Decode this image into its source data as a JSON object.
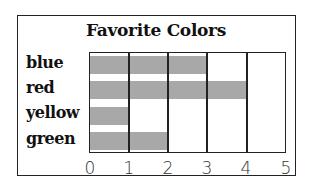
{
  "chart_data": {
    "type": "bar",
    "orientation": "horizontal",
    "title": "Favorite Colors",
    "categories": [
      "blue",
      "red",
      "yellow",
      "green"
    ],
    "values": [
      3,
      4,
      1,
      2
    ],
    "xlabel": "",
    "ylabel": "",
    "xlim": [
      0,
      5
    ],
    "x_ticks": [
      "0",
      "1",
      "2",
      "3",
      "4",
      "5"
    ],
    "grid": true,
    "legend": null,
    "bar_color": "#a8a8a8"
  }
}
